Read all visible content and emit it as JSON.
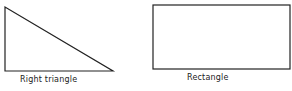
{
  "shapes": [
    {
      "name": "Right triangle",
      "type": "polygon",
      "points": "5,7 5,71 113,71"
    },
    {
      "name": "Rectangle",
      "type": "rect",
      "x": 153,
      "y": 5,
      "width": 137,
      "height": 64
    }
  ],
  "labels": {
    "triangle": "Right triangle",
    "rectangle": "Rectangle"
  },
  "colors": {
    "stroke": "#222222",
    "background": "#ffffff"
  }
}
